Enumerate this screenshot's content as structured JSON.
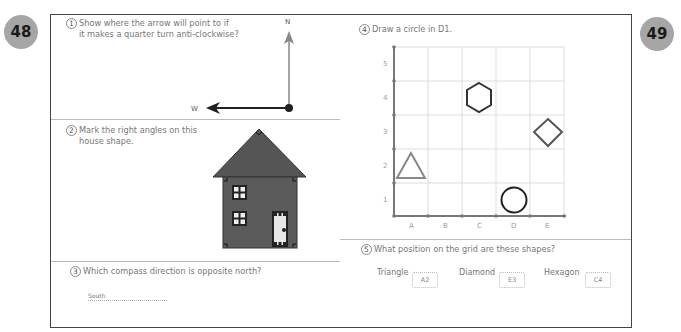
{
  "pages": {
    "left": "48",
    "right": "49"
  },
  "q1": {
    "number": "1",
    "text_line1": "Show where the arrow will point to if",
    "text_line2": "it makes a quarter turn anti-clockwise?",
    "north_label": "N",
    "west_label": "W"
  },
  "q2": {
    "number": "2",
    "text_line1": "Mark the right angles on this",
    "text_line2": "house shape."
  },
  "q3": {
    "number": "3",
    "text": "Which compass direction is opposite north?",
    "answer": "South"
  },
  "q4": {
    "number": "4",
    "text": "Draw a circle in D1.",
    "grid": {
      "columns": [
        "A",
        "B",
        "C",
        "D",
        "E"
      ],
      "rows": [
        "1",
        "2",
        "3",
        "4",
        "5"
      ],
      "shapes": [
        {
          "type": "triangle",
          "cell": "A2",
          "color": "#888888"
        },
        {
          "type": "hexagon",
          "cell": "C4",
          "color": "#333333"
        },
        {
          "type": "diamond",
          "cell": "E3",
          "color": "#555555"
        },
        {
          "type": "circle",
          "cell": "D1",
          "color": "#222222"
        }
      ]
    }
  },
  "q5": {
    "number": "5",
    "text": "What position on the grid are these shapes?",
    "items": [
      {
        "label": "Triangle",
        "answer": "A2"
      },
      {
        "label": "Diamond",
        "answer": "E3"
      },
      {
        "label": "Hexagon",
        "answer": "C4"
      }
    ]
  },
  "colors": {
    "badge": "#a6a6a6",
    "house": "#5a5a5a",
    "roof": "#555555",
    "frame": "#444444"
  }
}
